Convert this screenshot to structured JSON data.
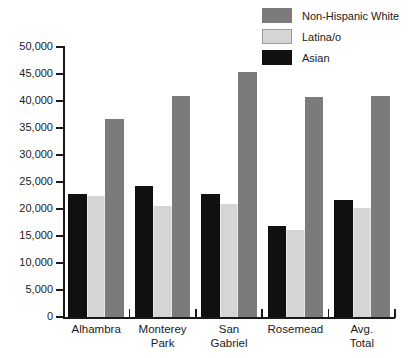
{
  "chart_data": {
    "type": "bar",
    "title": "",
    "subtitle": "",
    "xlabel": "",
    "ylabel": "",
    "ylim": [
      0,
      50000
    ],
    "grid": false,
    "legend_position": "top-right",
    "categories": [
      "Alhambra",
      "Monterey Park",
      "San Gabriel",
      "Rosemead",
      "Avg. Total"
    ],
    "category_lines": [
      [
        "Alhambra"
      ],
      [
        "Monterey",
        "Park"
      ],
      [
        "San",
        "Gabriel"
      ],
      [
        "Rosemead"
      ],
      [
        "Avg.",
        "Total"
      ]
    ],
    "ytick_labels": [
      "50,000",
      "45,000",
      "40,000",
      "35,000",
      "30,000",
      "25,000",
      "20,000",
      "15,000",
      "10,000",
      "5,000",
      "0"
    ],
    "ytick_values": [
      50000,
      45000,
      40000,
      35000,
      30000,
      25000,
      20000,
      15000,
      10000,
      5000,
      0
    ],
    "series": [
      {
        "name": "Asian",
        "color": "#101010",
        "values": [
          22700,
          24300,
          22700,
          16800,
          21600
        ]
      },
      {
        "name": "Latina/o",
        "color": "#d5d5d5",
        "values": [
          22500,
          20600,
          21000,
          16100,
          20100
        ]
      },
      {
        "name": "Non-Hispanic White",
        "color": "#7b7b7b",
        "values": [
          36700,
          41000,
          45300,
          40700,
          41000
        ]
      }
    ]
  },
  "legend": {
    "items": [
      {
        "label": "Non-Hispanic White",
        "color": "#7b7b7b"
      },
      {
        "label": "Latina/o",
        "color": "#d5d5d5"
      },
      {
        "label": "Asian",
        "color": "#101010"
      }
    ]
  }
}
